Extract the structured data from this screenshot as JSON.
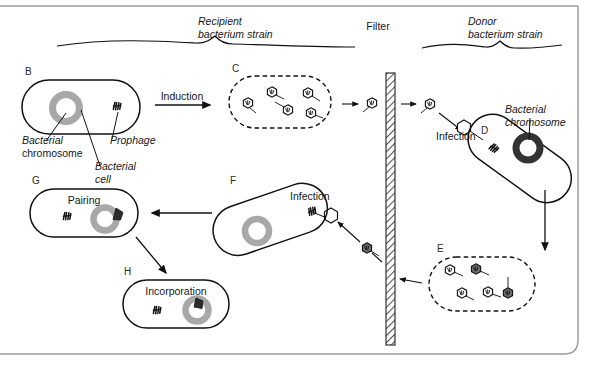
{
  "figure": {
    "title_labels": {
      "recipient_line1": "Recipient",
      "recipient_line2": "bacterium strain",
      "donor_line1": "Donor",
      "donor_line2": "bacterium strain",
      "filter": "Filter"
    },
    "panels": [
      {
        "id": "B",
        "letter": "B",
        "caption": ""
      },
      {
        "id": "C",
        "letter": "C",
        "caption": ""
      },
      {
        "id": "D",
        "letter": "D",
        "caption": ""
      },
      {
        "id": "E",
        "letter": "E",
        "caption": ""
      },
      {
        "id": "F",
        "letter": "F",
        "caption": ""
      },
      {
        "id": "G",
        "letter": "G",
        "caption": "Pairing"
      },
      {
        "id": "H",
        "letter": "H",
        "caption": "Incorporation"
      }
    ],
    "annotations": {
      "bacterial_chromosome_l1": "Bacterial",
      "bacterial_chromosome_l2": "chromosome",
      "bacterial_cell_l1": "Bacterial",
      "bacterial_cell_l2": "cell",
      "prophage": "Prophage",
      "donor_chromosome_l1": "Bacterial",
      "donor_chromosome_l2": "chromosome"
    },
    "process_labels": {
      "induction": "Induction",
      "infection_right": "Infection",
      "infection_left": "Infection"
    },
    "phage_counts": {
      "panel_c": 5,
      "panel_e": 5
    },
    "colors": {
      "ink": "#111111",
      "frame": "#9a9a9a",
      "chromosome_grey": "#a8a8a8",
      "chromosome_dark": "#333333",
      "fragment_dark": "#2b2b2b",
      "background": "#ffffff"
    }
  }
}
